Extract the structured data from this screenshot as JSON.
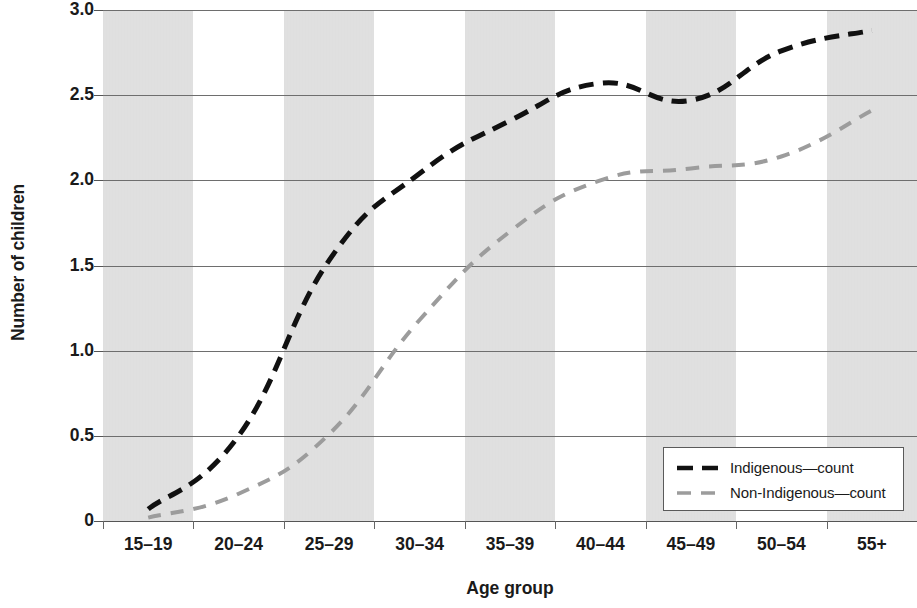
{
  "chart_data": {
    "type": "line",
    "title": "",
    "xlabel": "Age group",
    "ylabel": "Number of children",
    "categories": [
      "15–19",
      "20–24",
      "25–29",
      "30–34",
      "35–39",
      "40–44",
      "45–49",
      "50–54",
      "55+"
    ],
    "series": [
      {
        "name": "Indigenous—count",
        "color": "#111111",
        "dash": "dashed",
        "values": [
          0.07,
          0.5,
          1.53,
          2.04,
          2.35,
          2.57,
          2.47,
          2.76,
          2.88
        ]
      },
      {
        "name": "Non-Indigenous—count",
        "color": "#9c9c9c",
        "dash": "dashed",
        "values": [
          0.02,
          0.16,
          0.51,
          1.18,
          1.7,
          2.0,
          2.07,
          2.14,
          2.41
        ]
      }
    ],
    "ylim": [
      0,
      3.0
    ],
    "ytick_values": [
      3.0,
      2.5,
      2.0,
      1.5,
      1.0,
      0.5,
      0
    ],
    "ytick_labels": [
      "3.0",
      "2.5",
      "2.0",
      "1.5",
      "1.0",
      "0.5",
      "0"
    ],
    "grid": "horizontal",
    "legend_position": "bottom-right",
    "band_shading": "alternating-gray-by-category",
    "band_color": "#e3e3e3"
  },
  "axes": {
    "y_title": "Number of children",
    "x_title": "Age group"
  },
  "legend": {
    "entries": [
      {
        "label": "Indigenous—count"
      },
      {
        "label": "Non-Indigenous—count"
      }
    ]
  }
}
